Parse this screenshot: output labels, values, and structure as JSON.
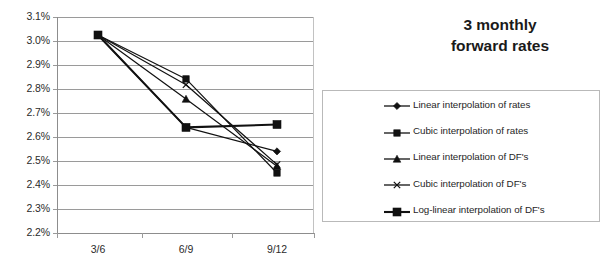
{
  "title": {
    "line1": "3 monthly",
    "line2": "forward rates"
  },
  "axis": {
    "y_ticks": [
      "3.1%",
      "3.0%",
      "2.9%",
      "2.8%",
      "2.7%",
      "2.6%",
      "2.5%",
      "2.4%",
      "2.3%",
      "2.2%"
    ],
    "x_ticks": [
      "3/6",
      "6/9",
      "9/12"
    ]
  },
  "legend": {
    "entries": [
      {
        "label": "Linear interpolation of rates",
        "marker": "diamond-marker"
      },
      {
        "label": "Cubic interpolation of rates",
        "marker": "square-marker"
      },
      {
        "label": "Linear interpolation of DF's",
        "marker": "triangle-marker"
      },
      {
        "label": "Cubic interpolation of DF's",
        "marker": "x-marker"
      },
      {
        "label": "Log-linear interpolation of DF's",
        "marker": "bold-square-marker"
      }
    ]
  },
  "chart_data": {
    "type": "line",
    "title": "3 monthly forward rates",
    "xlabel": "",
    "ylabel": "",
    "categories": [
      "3/6",
      "6/9",
      "9/12"
    ],
    "ylim": [
      2.2,
      3.1
    ],
    "ytick_step": 0.1,
    "yunit": "%",
    "grid": true,
    "legend_position": "right",
    "series": [
      {
        "name": "Linear interpolation of rates",
        "marker": "diamond",
        "values": [
          3.025,
          2.64,
          2.54
        ]
      },
      {
        "name": "Cubic interpolation of rates",
        "marker": "square",
        "values": [
          3.025,
          2.842,
          2.45
        ]
      },
      {
        "name": "Linear interpolation of DF's",
        "marker": "triangle",
        "values": [
          3.025,
          2.758,
          2.478
        ]
      },
      {
        "name": "Cubic interpolation of DF's",
        "marker": "x",
        "values": [
          3.025,
          2.818,
          2.485
        ]
      },
      {
        "name": "Log-linear interpolation of DF's",
        "marker": "square",
        "values": [
          3.025,
          2.64,
          2.652
        ]
      }
    ]
  }
}
